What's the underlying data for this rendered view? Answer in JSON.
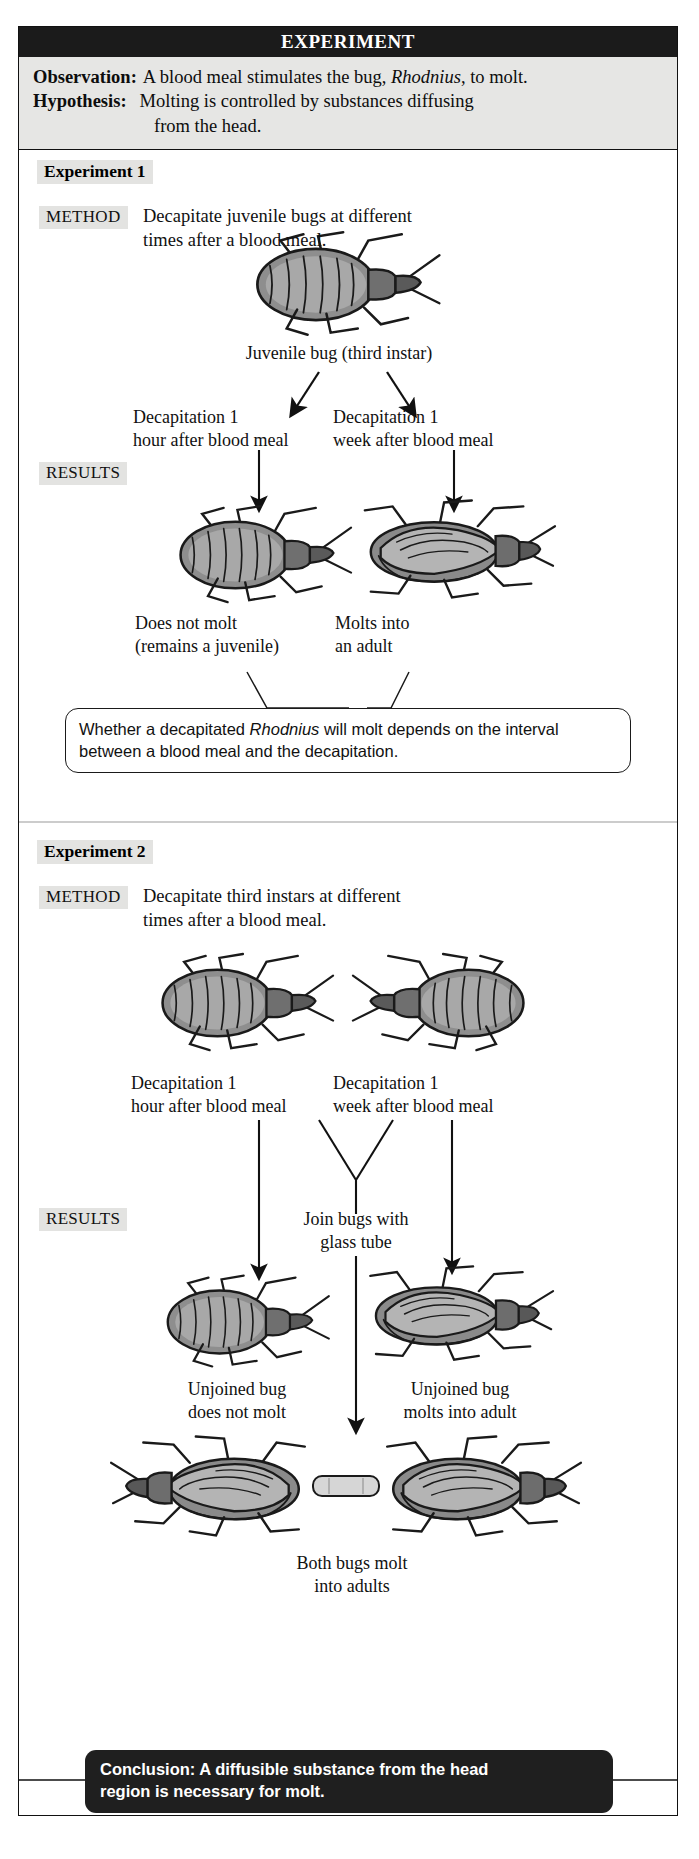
{
  "header": {
    "title": "EXPERIMENT"
  },
  "premise": {
    "observation_label": "Observation:",
    "observation_text_a": "A blood meal stimulates the bug, ",
    "observation_species": "Rhodnius",
    "observation_text_b": ", to molt.",
    "hypothesis_label": "Hypothesis:",
    "hypothesis_line1": "Molting is controlled by substances diffusing",
    "hypothesis_line2": "from the head."
  },
  "experiment1": {
    "title": "Experiment 1",
    "method_label": "METHOD",
    "method_line1": "Decapitate juvenile bugs at different",
    "method_line2": "times after a blood meal.",
    "subject_caption": "Juvenile bug (third instar)",
    "branch_left_line1": "Decapitation 1",
    "branch_left_line2": "hour after blood meal",
    "branch_right_line1": "Decapitation 1",
    "branch_right_line2": "week after blood meal",
    "results_label": "RESULTS",
    "result_left_line1": "Does not molt",
    "result_left_line2": "(remains a juvenile)",
    "result_right_line1": "Molts into",
    "result_right_line2": "an adult",
    "callout_text_a": "Whether a decapitated ",
    "callout_species": "Rhodnius",
    "callout_text_b": " will molt depends on the interval between a blood meal and the decapitation."
  },
  "experiment2": {
    "title": "Experiment 2",
    "method_label": "METHOD",
    "method_line1": "Decapitate third instars at different",
    "method_line2": "times after a blood meal.",
    "branch_left_line1": "Decapitation 1",
    "branch_left_line2": "hour after blood meal",
    "branch_right_line1": "Decapitation 1",
    "branch_right_line2": "week after blood meal",
    "results_label": "RESULTS",
    "join_line1": "Join bugs with",
    "join_line2": "glass tube",
    "result_left_line1": "Unjoined bug",
    "result_left_line2": "does not molt",
    "result_right_line1": "Unjoined bug",
    "result_right_line2": "molts into adult",
    "result_joined_line1": "Both bugs molt",
    "result_joined_line2": "into adults"
  },
  "conclusion": {
    "line1": "Conclusion: A diffusible substance from the head",
    "line2": "region is necessary for molt."
  },
  "colors": {
    "header_bar": "#1b1b1b",
    "premise_bg": "#e6e6e4",
    "highlight": "#e3e3e1",
    "conclusion_bg": "#1f1f1f",
    "ink": "#111111"
  }
}
